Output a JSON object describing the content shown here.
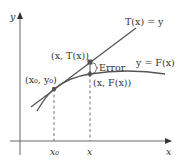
{
  "diagram": {
    "type": "tangent-line-approximation",
    "axes": {
      "x_label": "x",
      "y_label": "y"
    },
    "curves": {
      "tangent_label": "T(x) = y",
      "function_label": "y = F(x)"
    },
    "points": {
      "base_point_label": "(x₀, y₀)",
      "tangent_point_label": "(x, T(x))",
      "function_point_label": "(x, F(x))"
    },
    "annotations": {
      "error_label": "Error"
    },
    "ticks": {
      "x0_label": "x₀",
      "x_label": "x"
    },
    "colors": {
      "axis": "#555555",
      "curve": "#555555",
      "point": "#555555",
      "text": "#333333"
    }
  }
}
